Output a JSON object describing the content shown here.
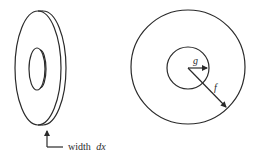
{
  "figure": {
    "left": {
      "title": "washer-side-view",
      "label_prefix": "width",
      "label_var": "dx"
    },
    "right": {
      "title": "annulus-front-view",
      "inner_radius_label": "g",
      "outer_radius_label": "f"
    }
  },
  "colors": {
    "stroke": "#2a2a2a",
    "background": "#ffffff"
  }
}
